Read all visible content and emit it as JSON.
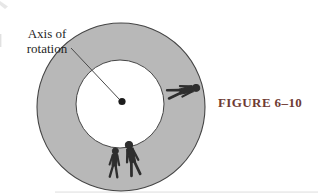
{
  "figure": {
    "caption": "FIGURE 6–10",
    "axis_label": {
      "line1": "Axis of",
      "line2": "rotation"
    },
    "colors": {
      "background": "#ffffff",
      "ring_fill": "#b8b8b8",
      "ring_outline": "#454545",
      "hub_dot": "#1c1c1c",
      "leader_line": "#4a4a4a",
      "silhouette": "#2e2e2e",
      "label_text": "#1f1f1f",
      "caption_text": "#6e3b34"
    }
  }
}
